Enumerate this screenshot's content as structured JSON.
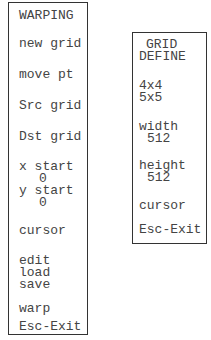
{
  "warping_menu": {
    "title": "WARPING",
    "items": [
      {
        "label": "new grid"
      },
      {
        "label": "move pt"
      },
      {
        "label": "Src grid"
      },
      {
        "label": "Dst grid"
      },
      {
        "label": "x start"
      },
      {
        "label": "0"
      },
      {
        "label": "y start"
      },
      {
        "label": "0"
      },
      {
        "label": "cursor"
      },
      {
        "label": "edit"
      },
      {
        "label": "load"
      },
      {
        "label": "save"
      },
      {
        "label": "warp"
      },
      {
        "label": "Esc-Exit"
      }
    ]
  },
  "grid_define_menu": {
    "title_line1": "GRID",
    "title_line2": "DEFINE",
    "items": [
      {
        "label": "4x4"
      },
      {
        "label": "5x5"
      },
      {
        "label": "width"
      },
      {
        "label": "512"
      },
      {
        "label": "height"
      },
      {
        "label": "512"
      },
      {
        "label": "cursor"
      },
      {
        "label": "Esc-Exit"
      }
    ]
  }
}
